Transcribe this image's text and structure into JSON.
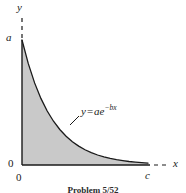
{
  "figure": {
    "caption": "Problem 5/52",
    "background_color": "#ffffff",
    "ink_color": "#1a1a1a",
    "fill_color": "#c9c9c9"
  },
  "labels": {
    "y_axis": "y",
    "x_axis": "x",
    "a": "a",
    "c": "c",
    "zero_on_y_axis": "0",
    "zero_at_origin": "0"
  },
  "equation": {
    "lhs": "y",
    "operator": "=",
    "coefficient": "ae",
    "exponent": "−bx"
  },
  "chart_data": {
    "type": "area",
    "title": "",
    "subtitle": "",
    "xlabel": "x",
    "ylabel": "y",
    "legend": [],
    "grid": false,
    "annotations": [
      {
        "text": "y = ae^{-bx}",
        "x": 0.42,
        "y": 0.36
      }
    ],
    "xticks": [
      {
        "value": 0,
        "label": "0"
      },
      {
        "value": 1,
        "label": "c"
      }
    ],
    "yticks": [
      {
        "value": 0,
        "label": "0"
      },
      {
        "value": 1,
        "label": "a"
      }
    ],
    "xlim": [
      0,
      1.12
    ],
    "ylim": [
      0,
      1.08
    ],
    "axis_style": {
      "x_axis_solid_to": 1.0,
      "x_axis_dashed_from": 1.02,
      "x_axis_dashed_to": 1.12,
      "y_axis_solid_to": 1.0,
      "y_axis_dashed_from": 1.02,
      "y_axis_dashed_to": 1.2
    },
    "series": [
      {
        "name": "y = ae^{-bx}",
        "equation": "y = a*exp(-b*x)",
        "parameters": {
          "a": 1.0,
          "b": 4.2
        },
        "filled": true,
        "fill_color": "#c9c9c9",
        "line_color": "#1a1a1a",
        "x": [
          0.0,
          0.05,
          0.1,
          0.15,
          0.2,
          0.25,
          0.3,
          0.35,
          0.4,
          0.45,
          0.5,
          0.55,
          0.6,
          0.65,
          0.7,
          0.75,
          0.8,
          0.85,
          0.9,
          0.95,
          1.0
        ],
        "values": [
          1.0,
          0.811,
          0.657,
          0.533,
          0.432,
          0.35,
          0.284,
          0.23,
          0.186,
          0.151,
          0.122,
          0.099,
          0.08,
          0.065,
          0.053,
          0.043,
          0.035,
          0.028,
          0.023,
          0.019,
          0.015
        ]
      }
    ]
  }
}
